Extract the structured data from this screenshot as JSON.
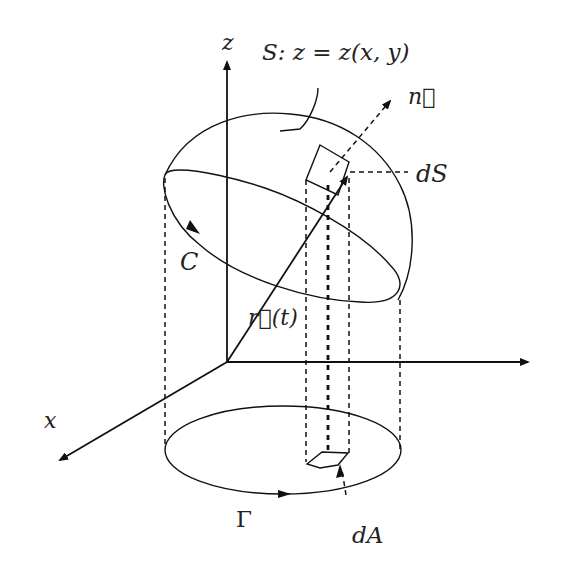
{
  "diagram": {
    "labels": {
      "z_axis": "z",
      "x_axis": "x",
      "surface_eq": "S: z = z(x, y)",
      "normal": "n⃗",
      "surface_element": "dS",
      "curve_C": "C",
      "position_vector": "r⃗(t)",
      "projected_curve": "Γ",
      "area_element": "dA"
    },
    "colors": {
      "ink": "#111111",
      "background": "#ffffff"
    }
  }
}
